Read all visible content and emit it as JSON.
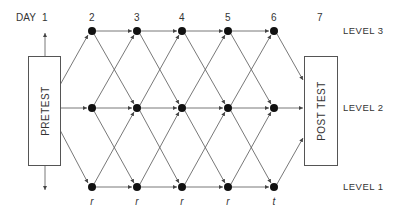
{
  "days": {
    "prefix": "DAY",
    "labels": [
      "1",
      "2",
      "3",
      "4",
      "5",
      "6",
      "7"
    ]
  },
  "levels": [
    "LEVEL 3",
    "LEVEL 2",
    "LEVEL 1"
  ],
  "boxes": {
    "pretest": "PRETEST",
    "posttest": "POST TEST"
  },
  "level1_node_labels": [
    "r",
    "r",
    "r",
    "r",
    "t"
  ],
  "colors": {
    "node": "#111111",
    "line": "#555555"
  }
}
